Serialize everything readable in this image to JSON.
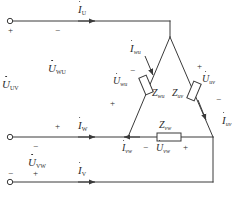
{
  "diagram": {
    "type": "electrical-schematic",
    "colors": {
      "line": "#3a3a3a",
      "text": "#2b2b2b",
      "background": "#ffffff"
    },
    "terminals": [
      {
        "id": "u",
        "label": "U-terminal"
      },
      {
        "id": "w",
        "label": "W-terminal"
      },
      {
        "id": "v",
        "label": "V-terminal"
      }
    ],
    "line_currents": [
      {
        "symbol": "I",
        "sub": "U",
        "dot": true,
        "text": "İU"
      },
      {
        "symbol": "I",
        "sub": "W",
        "dot": true,
        "text": "İW"
      },
      {
        "symbol": "I",
        "sub": "V",
        "dot": true,
        "text": "İV"
      }
    ],
    "line_voltages": [
      {
        "symbol": "U",
        "sub": "UV",
        "dot": true,
        "text": "U̇UV"
      },
      {
        "symbol": "U",
        "sub": "VW",
        "dot": true,
        "text": "U̇VW"
      },
      {
        "symbol": "U",
        "sub": "WU",
        "dot": true,
        "text": "U̇WU"
      }
    ],
    "phase_currents": [
      {
        "symbol": "I",
        "sub": "wu",
        "dot": true,
        "text": "İwu"
      },
      {
        "symbol": "I",
        "sub": "uv",
        "dot": true,
        "text": "İuv"
      },
      {
        "symbol": "I",
        "sub": "vw",
        "dot": true,
        "text": "İvw"
      }
    ],
    "phase_voltages": [
      {
        "symbol": "U",
        "sub": "wu",
        "dot": true,
        "text": "U̇wu"
      },
      {
        "symbol": "U",
        "sub": "uv",
        "dot": true,
        "text": "U̇uv"
      },
      {
        "symbol": "U",
        "sub": "vw",
        "dot": true,
        "text": "U̇vw"
      }
    ],
    "impedances": [
      {
        "symbol": "Z",
        "sub": "wu",
        "text": "Zwu"
      },
      {
        "symbol": "Z",
        "sub": "uv",
        "text": "Zuv"
      },
      {
        "symbol": "Z",
        "sub": "vw",
        "text": "Zvw"
      }
    ],
    "symbols": {
      "I": "I",
      "U": "U",
      "Z": "Z",
      "plus": "+",
      "minus": "−"
    },
    "subscripts": {
      "U": "U",
      "V": "V",
      "W": "W",
      "UV": "UV",
      "VW": "VW",
      "WU": "WU",
      "wu": "wu",
      "uv": "uv",
      "vw": "vw"
    },
    "polarity_marks": {
      "u_line_left": "+",
      "u_line_mid": "−",
      "w_line_above": "+",
      "w_line_below": "−",
      "v_line_left": "−",
      "v_line_above": "+",
      "vw_top": "−",
      "wu_branch_top": "−",
      "wu_branch_bottom": "+",
      "uv_branch_top": "+",
      "uv_branch_bottom": "−",
      "vw_branch_left": "−",
      "vw_branch_right": "+"
    }
  }
}
